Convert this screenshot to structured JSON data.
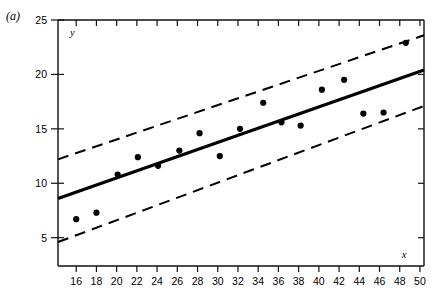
{
  "figure": {
    "panel_label": "(a)"
  },
  "chart_data": {
    "type": "scatter",
    "title": "",
    "subtitle": "",
    "xlabel": "x",
    "ylabel": "y",
    "xlim": [
      14.2,
      50.4
    ],
    "ylim": [
      2.4,
      25.0
    ],
    "grid": false,
    "legend": "none",
    "x_ticks": [
      16,
      18,
      20,
      22,
      24,
      26,
      28,
      30,
      32,
      34,
      36,
      38,
      40,
      42,
      44,
      46,
      48,
      50
    ],
    "x_tick_labels": [
      "16",
      "18",
      "20",
      "22",
      "24",
      "26",
      "28",
      "30",
      "32",
      "34",
      "36",
      "38",
      "40",
      "42",
      "44",
      "46",
      "48",
      "50"
    ],
    "y_ticks": [
      5,
      10,
      15,
      20,
      25
    ],
    "y_tick_labels": [
      "5",
      "10",
      "15",
      "20",
      "25"
    ],
    "points": [
      {
        "x": 16.0,
        "y": 6.7
      },
      {
        "x": 18.0,
        "y": 7.3
      },
      {
        "x": 20.1,
        "y": 10.8
      },
      {
        "x": 22.1,
        "y": 12.4
      },
      {
        "x": 24.1,
        "y": 11.6
      },
      {
        "x": 26.2,
        "y": 13.0
      },
      {
        "x": 28.2,
        "y": 14.6
      },
      {
        "x": 30.2,
        "y": 12.5
      },
      {
        "x": 32.2,
        "y": 15.0
      },
      {
        "x": 34.5,
        "y": 17.4
      },
      {
        "x": 36.3,
        "y": 15.6
      },
      {
        "x": 38.2,
        "y": 15.3
      },
      {
        "x": 40.3,
        "y": 18.6
      },
      {
        "x": 42.5,
        "y": 19.5
      },
      {
        "x": 44.4,
        "y": 16.4
      },
      {
        "x": 46.4,
        "y": 16.5
      },
      {
        "x": 48.6,
        "y": 22.9
      }
    ],
    "series": [
      {
        "name": "fitted regression line",
        "style": "solid",
        "x": [
          14.2,
          50.4
        ],
        "values": [
          8.6,
          20.4
        ]
      },
      {
        "name": "upper confidence band",
        "style": "dashed",
        "x": [
          14.2,
          50.4
        ],
        "values": [
          12.2,
          23.6
        ]
      },
      {
        "name": "lower confidence band",
        "style": "dashed",
        "x": [
          14.2,
          50.4
        ],
        "values": [
          4.6,
          17.1
        ]
      }
    ]
  }
}
